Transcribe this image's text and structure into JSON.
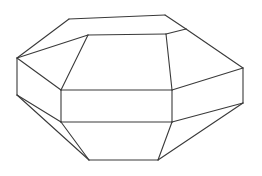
{
  "figure": {
    "kind": "line-drawing",
    "background_color": "#ffffff",
    "stroke_color": "#3a3a3a",
    "stroke_width": 1.1,
    "canvas": {
      "width": 262,
      "height": 176
    },
    "vertices": {
      "top_back_left": [
        69,
        19
      ],
      "top_back_right": [
        165,
        15
      ],
      "top_right": [
        186,
        29
      ],
      "top_front_right": [
        166,
        34
      ],
      "top_front_left": [
        88,
        35
      ],
      "top_left": [
        17,
        58
      ],
      "waist_top_left": [
        61,
        90
      ],
      "waist_top_right": [
        172,
        90
      ],
      "waist_bot_left": [
        61,
        122
      ],
      "waist_bot_right": [
        172,
        122
      ],
      "side_left_upper": [
        17,
        58
      ],
      "side_left_lower": [
        17,
        95
      ],
      "side_right_upper": [
        243,
        68
      ],
      "side_right_lower": [
        243,
        103
      ],
      "bottom_left": [
        89,
        160
      ],
      "bottom_right": [
        158,
        160
      ]
    },
    "edges": [
      {
        "name": "top-face-back-edge",
        "from": "top_back_left",
        "to": "top_back_right"
      },
      {
        "name": "top-face-right-back-edge",
        "from": "top_back_right",
        "to": "top_right"
      },
      {
        "name": "top-face-right-front-edge",
        "from": "top_right",
        "to": "top_front_right"
      },
      {
        "name": "top-face-front-edge",
        "from": "top_front_right",
        "to": "top_front_left"
      },
      {
        "name": "top-face-left-front-edge",
        "from": "top_front_left",
        "to": "top_left"
      },
      {
        "name": "top-face-left-back-edge",
        "from": "top_left",
        "to": "top_back_left"
      },
      {
        "name": "upper-panel-left-edge",
        "from": "top_front_left",
        "to": "waist_top_left"
      },
      {
        "name": "upper-panel-right-edge",
        "from": "top_front_right",
        "to": "waist_top_right"
      },
      {
        "name": "upper-panel-far-left-edge",
        "from": "top_left",
        "to": "side_left_upper"
      },
      {
        "name": "upper-panel-far-right-edge",
        "from": "top_right",
        "to": "side_right_upper"
      },
      {
        "name": "waist-top-line",
        "from": "waist_top_left",
        "to": "waist_top_right"
      },
      {
        "name": "waist-bottom-line",
        "from": "waist_bot_left",
        "to": "waist_bot_right"
      },
      {
        "name": "waist-left-vertical",
        "from": "waist_top_left",
        "to": "waist_bot_left"
      },
      {
        "name": "waist-right-vertical",
        "from": "waist_top_right",
        "to": "waist_bot_right"
      },
      {
        "name": "left-side-vertical",
        "from": "side_left_upper",
        "to": "side_left_lower"
      },
      {
        "name": "right-side-vertical",
        "from": "side_right_upper",
        "to": "side_right_lower"
      },
      {
        "name": "left-waist-top-diagonal",
        "from": "side_left_upper",
        "to": "waist_top_left"
      },
      {
        "name": "right-waist-top-diagonal",
        "from": "side_right_upper",
        "to": "waist_top_right"
      },
      {
        "name": "left-waist-bot-diagonal",
        "from": "side_left_lower",
        "to": "waist_bot_left"
      },
      {
        "name": "right-waist-bot-diagonal",
        "from": "side_right_lower",
        "to": "waist_bot_right"
      },
      {
        "name": "lower-left-sliver-edge",
        "from": "side_left_lower",
        "to": "bottom_left"
      },
      {
        "name": "lower-right-sliver-edge",
        "from": "side_right_lower",
        "to": "bottom_right"
      },
      {
        "name": "lower-panel-left-edge",
        "from": "waist_bot_left",
        "to": "bottom_left"
      },
      {
        "name": "lower-panel-right-edge",
        "from": "waist_bot_right",
        "to": "bottom_right"
      },
      {
        "name": "bottom-edge",
        "from": "bottom_left",
        "to": "bottom_right"
      }
    ]
  }
}
